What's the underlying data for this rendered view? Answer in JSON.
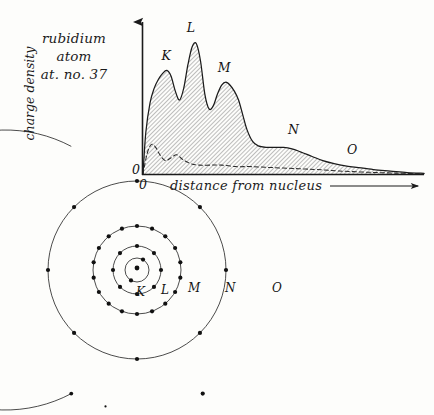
{
  "title_block": {
    "line1": "rubidium",
    "line2": "atom",
    "line3": "at. no. 37"
  },
  "chart_data": {
    "type": "area",
    "title": "rubidium atom at. no. 37",
    "xlabel": "distance from nucleus",
    "ylabel": "charge density",
    "origin_label": "0",
    "axis_origin_label_below": "0",
    "grid": false,
    "legend": "none",
    "xlim": [
      0,
      100
    ],
    "ylim": [
      0,
      100
    ],
    "annotations": [
      {
        "label": "K",
        "x": 8,
        "y": 74
      },
      {
        "label": "L",
        "x": 17,
        "y": 93
      },
      {
        "label": "M",
        "x": 28,
        "y": 66
      },
      {
        "label": "N",
        "x": 53,
        "y": 24
      },
      {
        "label": "O",
        "x": 74,
        "y": 11
      }
    ],
    "series": [
      {
        "name": "total charge density",
        "style": "solid-hatched",
        "x": [
          0.0,
          1.0,
          2.5,
          4.0,
          5.5,
          7.0,
          8.5,
          10.0,
          11.5,
          13.0,
          14.5,
          16.0,
          17.5,
          19.0,
          20.5,
          22.0,
          23.5,
          25.0,
          26.5,
          28.0,
          29.5,
          31.0,
          32.5,
          34.0,
          35.5,
          37.0,
          39.0,
          41.0,
          44.0,
          47.0,
          50.0,
          53.0,
          56.0,
          60.0,
          64.0,
          68.0,
          72.0,
          76.0,
          82.0,
          88.0,
          94.0,
          100.0
        ],
        "y": [
          0.0,
          28.0,
          48.0,
          58.0,
          64.0,
          68.0,
          70.0,
          66.0,
          56.0,
          50.0,
          58.0,
          74.0,
          86.0,
          88.0,
          76.0,
          54.0,
          44.0,
          46.0,
          54.0,
          60.0,
          62.0,
          60.0,
          56.0,
          50.0,
          40.0,
          30.0,
          22.0,
          19.0,
          18.0,
          18.0,
          18.0,
          17.0,
          15.0,
          12.0,
          9.0,
          7.0,
          5.5,
          4.5,
          3.0,
          2.0,
          1.0,
          0.4
        ]
      },
      {
        "name": "inner sub-shell contribution",
        "style": "dashed",
        "x": [
          0.0,
          1.5,
          3.0,
          4.5,
          6.0,
          8.0,
          10.0,
          12.0,
          14.0,
          17.0,
          20.0,
          24.0,
          28.0,
          33.0,
          38.0,
          44.0,
          50.0,
          56.0,
          62.0,
          70.0,
          80.0,
          90.0,
          100.0
        ],
        "y": [
          0.0,
          14.0,
          20.0,
          18.0,
          13.0,
          9.0,
          11.0,
          13.0,
          10.0,
          7.0,
          6.0,
          6.0,
          6.0,
          5.0,
          5.0,
          4.5,
          4.0,
          3.5,
          3.0,
          2.0,
          1.2,
          0.6,
          0.2
        ]
      }
    ]
  },
  "atom_diagram": {
    "center": {
      "x": 137,
      "y": 270
    },
    "nucleus_symbol": "nucleus-dot",
    "shells": [
      {
        "label": "K",
        "radius": 12,
        "electron_count": 2,
        "label_x": 136,
        "label_y": 285,
        "full_circle": true
      },
      {
        "label": "L",
        "radius": 24,
        "electron_count": 8,
        "label_x": 161,
        "label_y": 283,
        "full_circle": true
      },
      {
        "label": "M",
        "radius": 44,
        "electron_count": 18,
        "label_x": 188,
        "label_y": 281,
        "full_circle": true
      },
      {
        "label": "N",
        "radius": 89,
        "electron_count": 8,
        "label_x": 225,
        "label_y": 281,
        "full_circle": true
      },
      {
        "label": "O",
        "radius": 140,
        "electron_count": 1,
        "label_x": 272,
        "label_y": 281,
        "full_circle": false
      }
    ]
  },
  "colors": {
    "ink": "#1b1b1b",
    "paper": "#fdfdfb",
    "hatch": "#6a6a6a",
    "fill": "#dedad5"
  }
}
